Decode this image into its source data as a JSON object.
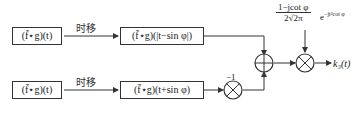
{
  "diagram": {
    "top_branch": {
      "input_block": "(f̄⋆g)(t)",
      "shift_label": "时移",
      "shifted_block": "(f̄⋆g)(|t−sin φ|)"
    },
    "bottom_branch": {
      "input_block": "(f̄⋆g)(t)",
      "shift_label": "时移",
      "shifted_block": "(f̄⋆g)(t+sin φ)",
      "gain": "−1"
    },
    "adder_symbol": "⊕",
    "multiplier_symbol": "⊗",
    "coefficient": {
      "numerator": "1−jcot φ",
      "denominator": "2√2π",
      "exponential": "e",
      "exponent": "−jt²cot φ"
    },
    "output_label": "k₃(t)"
  }
}
